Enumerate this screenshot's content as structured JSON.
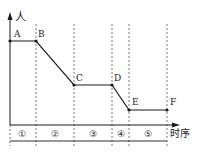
{
  "diagram": {
    "y_axis_label": "人",
    "x_axis_label": "时序",
    "points": [
      {
        "label": "A",
        "x": 10,
        "y": 41
      },
      {
        "label": "B",
        "x": 36,
        "y": 41
      },
      {
        "label": "C",
        "x": 74,
        "y": 85
      },
      {
        "label": "D",
        "x": 112,
        "y": 85
      },
      {
        "label": "E",
        "x": 129,
        "y": 110
      },
      {
        "label": "F",
        "x": 167,
        "y": 110
      }
    ],
    "stages": [
      {
        "label": "①",
        "x": 22
      },
      {
        "label": "②",
        "x": 55
      },
      {
        "label": "③",
        "x": 93
      },
      {
        "label": "④",
        "x": 120
      },
      {
        "label": "⑤",
        "x": 148
      }
    ],
    "dividers_x": [
      36,
      74,
      112,
      129,
      167
    ],
    "colors": {
      "line": "#1a1a1a",
      "dashed": "#555555"
    }
  }
}
